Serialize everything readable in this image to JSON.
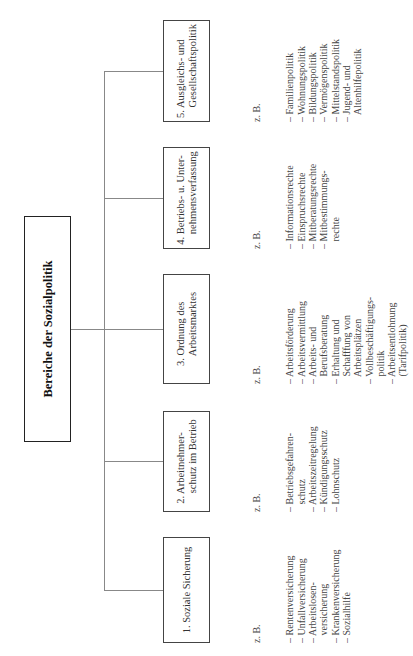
{
  "root": {
    "label": "Bereiche der Sozialpolitik"
  },
  "categories": [
    {
      "label": "1. Soziale Sicherung",
      "examples_label": "z. B.",
      "examples": "– Rentenversicherung\n– Unfallversicherung\n– Arbeitslosen-\n   versicherung\n– Krankenversicherung\n– Sozialhilfe"
    },
    {
      "label": "2. Arbeitnehmer-\n    schutz im Betrieb",
      "examples_label": "z. B.",
      "examples": "– Betriebsgefahren-\n   schutz\n– Arbeitszeitregelung\n– Kündigungsschutz\n– Lohnschutz"
    },
    {
      "label": "3. Ordnung des\n    Arbeitsmarktes",
      "examples_label": "z. B.",
      "examples": "– Arbeitsförderung\n– Arbeitsvermittlung\n– Arbeits- und\n   Berufsberatung\n– Erhaltung und\n   Schafffung von\n   Arbeitsplätzen\n– Vollbeschäftigungs-\n   politik\n– Arbeitsentlohnung\n   (Tarifpolitik)"
    },
    {
      "label": "4. Betriebs- u. Unter-\n    nehmensverfassung",
      "examples_label": "z. B.",
      "examples": "– Informationsrechte\n– Einspruchsrechte\n– Mitberatungsrechte\n– Mitbestimmungs-\n   rechte"
    },
    {
      "label": "5. Ausgleichs- und\n    Gesellschaftspolitik",
      "examples_label": "z. B.",
      "examples": "– Familienpolitik\n– Wohnungspolitik\n– Bildungspolitik\n– Vermögenspolitik\n– Mittelstandspolitik\n– Jugend- und\n   Altenhilfepolitik"
    }
  ],
  "colors": {
    "border": "#444444",
    "connector": "#888888",
    "text": "#333333"
  }
}
